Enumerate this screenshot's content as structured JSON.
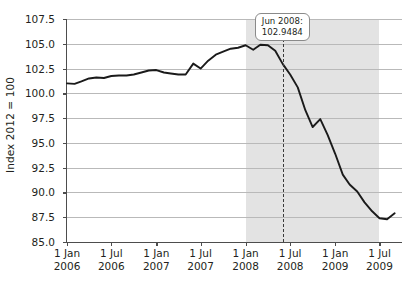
{
  "chart_data": {
    "type": "line",
    "title": "",
    "subtitle": "",
    "xlabel": "",
    "ylabel": "Index 2012 = 100",
    "ylim": [
      85.0,
      107.5
    ],
    "ytick_labels": [
      "107.5",
      "105.0",
      "102.5",
      "100.0",
      "97.5",
      "95.0",
      "92.5",
      "90.0",
      "87.5",
      "85.0"
    ],
    "ytick_values": [
      107.5,
      105.0,
      102.5,
      100.0,
      97.5,
      95.0,
      92.5,
      90.0,
      87.5,
      85.0
    ],
    "xtick_labels": [
      {
        "day_month": "1 Jan",
        "year": "2006"
      },
      {
        "day_month": "1 Jul",
        "year": "2006"
      },
      {
        "day_month": "1 Jan",
        "year": "2007"
      },
      {
        "day_month": "1 Jul",
        "year": "2007"
      },
      {
        "day_month": "1 Jan",
        "year": "2008"
      },
      {
        "day_month": "1 Jul",
        "year": "2008"
      },
      {
        "day_month": "1 Jan",
        "year": "2009"
      },
      {
        "day_month": "1 Jul",
        "year": "2009"
      }
    ],
    "xlim": [
      "2006-01-01",
      "2009-10-01"
    ],
    "grid": "horizontal",
    "legend": "none",
    "line_color": "#1a1a1a",
    "shade_color": "#e3e3e3",
    "grid_color": "#b9b9b9",
    "shaded_region": {
      "start": "2008-01-01",
      "end": "2009-07-01",
      "label": ""
    },
    "annotation": {
      "label": "Jun 2008:",
      "value": "102.9484",
      "x": "2008-06-01",
      "y": 102.9484,
      "marker_style": "dashed-vertical-line"
    },
    "x": [
      "2006-01-01",
      "2006-02-01",
      "2006-03-01",
      "2006-04-01",
      "2006-05-01",
      "2006-06-01",
      "2006-07-01",
      "2006-08-01",
      "2006-09-01",
      "2006-10-01",
      "2006-11-01",
      "2006-12-01",
      "2007-01-01",
      "2007-02-01",
      "2007-03-01",
      "2007-04-01",
      "2007-05-01",
      "2007-06-01",
      "2007-07-01",
      "2007-08-01",
      "2007-09-01",
      "2007-10-01",
      "2007-11-01",
      "2007-12-01",
      "2008-01-01",
      "2008-02-01",
      "2008-03-01",
      "2008-04-01",
      "2008-05-01",
      "2008-06-01",
      "2008-07-01",
      "2008-08-01",
      "2008-09-01",
      "2008-10-01",
      "2008-11-01",
      "2008-12-01",
      "2009-01-01",
      "2009-02-01",
      "2009-03-01",
      "2009-04-01",
      "2009-05-01",
      "2009-06-01",
      "2009-07-01",
      "2009-08-01",
      "2009-09-01"
    ],
    "values": [
      101.0,
      100.95,
      101.2,
      101.5,
      101.6,
      101.55,
      101.75,
      101.8,
      101.8,
      101.9,
      102.1,
      102.3,
      102.35,
      102.1,
      102.0,
      101.9,
      101.9,
      103.0,
      102.5,
      103.3,
      103.9,
      104.2,
      104.5,
      104.6,
      104.85,
      104.4,
      104.9,
      104.85,
      104.3,
      102.9484,
      101.9,
      100.6,
      98.3,
      96.6,
      97.4,
      95.8,
      93.9,
      91.8,
      90.8,
      90.1,
      89.0,
      88.1,
      87.4,
      87.3,
      87.9
    ],
    "series_name": "Index"
  }
}
